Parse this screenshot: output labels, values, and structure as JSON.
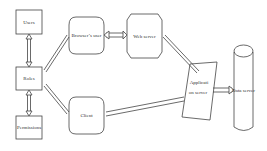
{
  "diagram": {
    "nodes": {
      "users": {
        "label": "Users"
      },
      "roles": {
        "label": "Roles"
      },
      "permissions": {
        "label": "Permissions"
      },
      "browser_user": {
        "label": "Browser’s user"
      },
      "web_server": {
        "label": "Web server"
      },
      "client": {
        "label": "Client"
      },
      "app_server": {
        "label_line1": "Applicati",
        "label_line2": "on server"
      },
      "data_server": {
        "label": "Data server"
      }
    },
    "edges": [
      {
        "from": "users",
        "to": "roles",
        "type": "double-arrow"
      },
      {
        "from": "roles",
        "to": "permissions",
        "type": "double-arrow"
      },
      {
        "from": "roles",
        "to": "browser_user",
        "type": "double-arrow"
      },
      {
        "from": "roles",
        "to": "client",
        "type": "double-arrow"
      },
      {
        "from": "browser_user",
        "to": "web_server",
        "type": "double-arrow"
      },
      {
        "from": "web_server",
        "to": "app_server",
        "type": "double-arrow"
      },
      {
        "from": "client",
        "to": "app_server",
        "type": "double-arrow"
      },
      {
        "from": "app_server",
        "to": "data_server",
        "type": "double-arrow"
      }
    ],
    "colors": {
      "stroke": "#444444",
      "text": "#333333",
      "background": "#ffffff"
    }
  }
}
